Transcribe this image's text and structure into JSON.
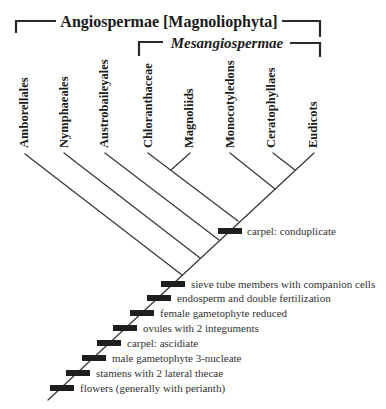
{
  "title": {
    "main": "Angiospermae [Magnoliophyta]",
    "sub": "Mesangiospermae"
  },
  "taxa": [
    {
      "name": "Amborellales",
      "x": 27,
      "top": 73,
      "tip": [
        25,
        154
      ],
      "join": [
        182,
        275
      ]
    },
    {
      "name": "Nymphaeales",
      "x": 67,
      "top": 73,
      "tip": [
        64,
        153
      ],
      "join": [
        200,
        258
      ]
    },
    {
      "name": "Austrobaileyales",
      "x": 107,
      "top": 55,
      "tip": [
        105,
        153
      ],
      "join": [
        219,
        240
      ]
    },
    {
      "name": "Chloranthaceae",
      "x": 151,
      "top": 60,
      "tip": [
        148,
        153
      ],
      "join": [
        238,
        221
      ]
    },
    {
      "name": "Magnoliids",
      "x": 192,
      "top": 88,
      "tip": [
        190,
        153
      ],
      "join": [
        171,
        170
      ]
    },
    {
      "name": "Monocotyledons",
      "x": 233,
      "top": 58,
      "tip": [
        230,
        153
      ],
      "join": [
        275,
        189
      ]
    },
    {
      "name": "Ceratophyllaes",
      "x": 274,
      "top": 63,
      "tip": [
        273,
        153
      ],
      "join": [
        295,
        170
      ]
    },
    {
      "name": "Eudicots",
      "x": 316,
      "top": 98,
      "tip": [
        314,
        153
      ],
      "join": [
        295,
        170
      ]
    }
  ],
  "trunk": {
    "from": [
      48,
      400
    ],
    "to": [
      314,
      153
    ]
  },
  "traits": [
    {
      "label": "carpel: conduplicate",
      "bar_x": 218,
      "y": 231
    },
    {
      "label": "sieve tube members with companion cells",
      "bar_x": 161,
      "y": 284
    },
    {
      "label": "endosperm and double fertilization",
      "bar_x": 147,
      "y": 298
    },
    {
      "label": "female gametophyte reduced",
      "bar_x": 130,
      "y": 313
    },
    {
      "label": "ovules with 2 integuments",
      "bar_x": 113,
      "y": 328
    },
    {
      "label": "carpel: ascidiate",
      "bar_x": 97,
      "y": 343
    },
    {
      "label": "male gametophyte 3-nucleate",
      "bar_x": 82,
      "y": 358
    },
    {
      "label": "stamens with 2 lateral thecae",
      "bar_x": 66,
      "y": 373
    },
    {
      "label": "flowers (generally with perianth)",
      "bar_x": 50,
      "y": 388
    }
  ]
}
